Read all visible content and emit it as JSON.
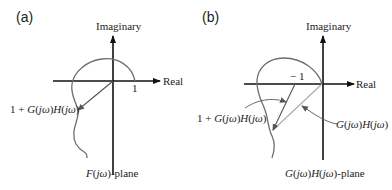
{
  "panels": [
    {
      "tag": "(a)",
      "axis_imag": "Imaginary",
      "axis_real": "Real",
      "tick_label": "1",
      "vector_label": {
        "pre": "1 + ",
        "g": "G",
        "p1": "(",
        "jw1": "jω",
        "p2": ")",
        "h": "H",
        "p3": "(",
        "jw2": "jω",
        "p4": ")"
      },
      "plane_label": {
        "f": "F",
        "p1": "(",
        "jw": "jω",
        "p2": ")",
        "suffix": "-plane"
      }
    },
    {
      "tag": "(b)",
      "axis_imag": "Imaginary",
      "axis_real": "Real",
      "tick_label": "− 1",
      "vector_label_1": {
        "pre": "1 + ",
        "g": "G",
        "p1": "(",
        "jw1": "jω",
        "p2": ")",
        "h": "H",
        "p3": "(",
        "jw2": "jω",
        "p4": ")"
      },
      "vector_label_2": {
        "g": "G",
        "p1": "(",
        "jw1": "jω",
        "p2": ")",
        "h": "H",
        "p3": "(",
        "jw2": "jω",
        "p4": ")"
      },
      "plane_label": {
        "g": "G",
        "p1": "(",
        "jw1": "jω",
        "p2": ")",
        "h": "H",
        "p3": "(",
        "jw2": "jω",
        "p4": ")",
        "suffix": "-plane"
      }
    }
  ],
  "colors": {
    "axis": "#111111",
    "curve": "#6e6e6e",
    "vector": "#555555",
    "vector_light": "#9a9a9a"
  }
}
